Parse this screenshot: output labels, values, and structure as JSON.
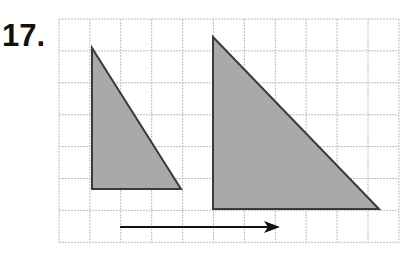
{
  "problem": {
    "number": "17."
  },
  "grid": {
    "x0": 59,
    "y0": 19,
    "cols": 11,
    "rows": 7,
    "cell_w": 30.9,
    "cell_h": 31.9,
    "line_color": "#bdbdbd"
  },
  "shapes": {
    "fill_color": "#a9a9a9",
    "stroke_color": "#3a3a3a",
    "small_triangle": {
      "points": "92,48 92,189 181,189"
    },
    "large_triangle": {
      "points": "213,37 213,209 379,209"
    }
  },
  "arrow": {
    "x1": 120,
    "y1": 227,
    "x2": 280,
    "y2": 227,
    "color": "#111111",
    "direction": "right"
  }
}
